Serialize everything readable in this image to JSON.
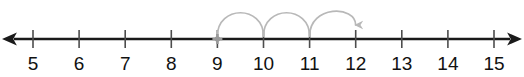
{
  "figure": {
    "type": "number-line"
  },
  "chart_data": {
    "type": "number-line",
    "title": "",
    "xlabel": "",
    "ylabel": "",
    "axis_min": 5,
    "axis_max": 15,
    "tick_step": 1,
    "tick_labels": [
      "5",
      "6",
      "7",
      "8",
      "9",
      "10",
      "11",
      "12",
      "13",
      "14",
      "15"
    ],
    "tick_values": [
      5,
      6,
      7,
      8,
      9,
      10,
      11,
      12,
      13,
      14,
      15
    ],
    "start_marker": {
      "value": 9,
      "label": "9",
      "style": "cross"
    },
    "jumps": [
      {
        "from": 9,
        "to": 10,
        "size": 1,
        "label": ""
      },
      {
        "from": 10,
        "to": 11,
        "size": 1,
        "label": ""
      },
      {
        "from": 11,
        "to": 12,
        "size": 1,
        "label": ""
      }
    ],
    "jump_count": 3,
    "end_value": 12,
    "arrowheads": [
      "left",
      "right"
    ],
    "grid": false,
    "legend": false
  },
  "colors": {
    "axis": "#1a1a1a",
    "tick": "#4d4d4d",
    "label": "#111111",
    "arc": "#b8b8b8",
    "marker": "#9a9a9a",
    "background": "#ffffff"
  }
}
